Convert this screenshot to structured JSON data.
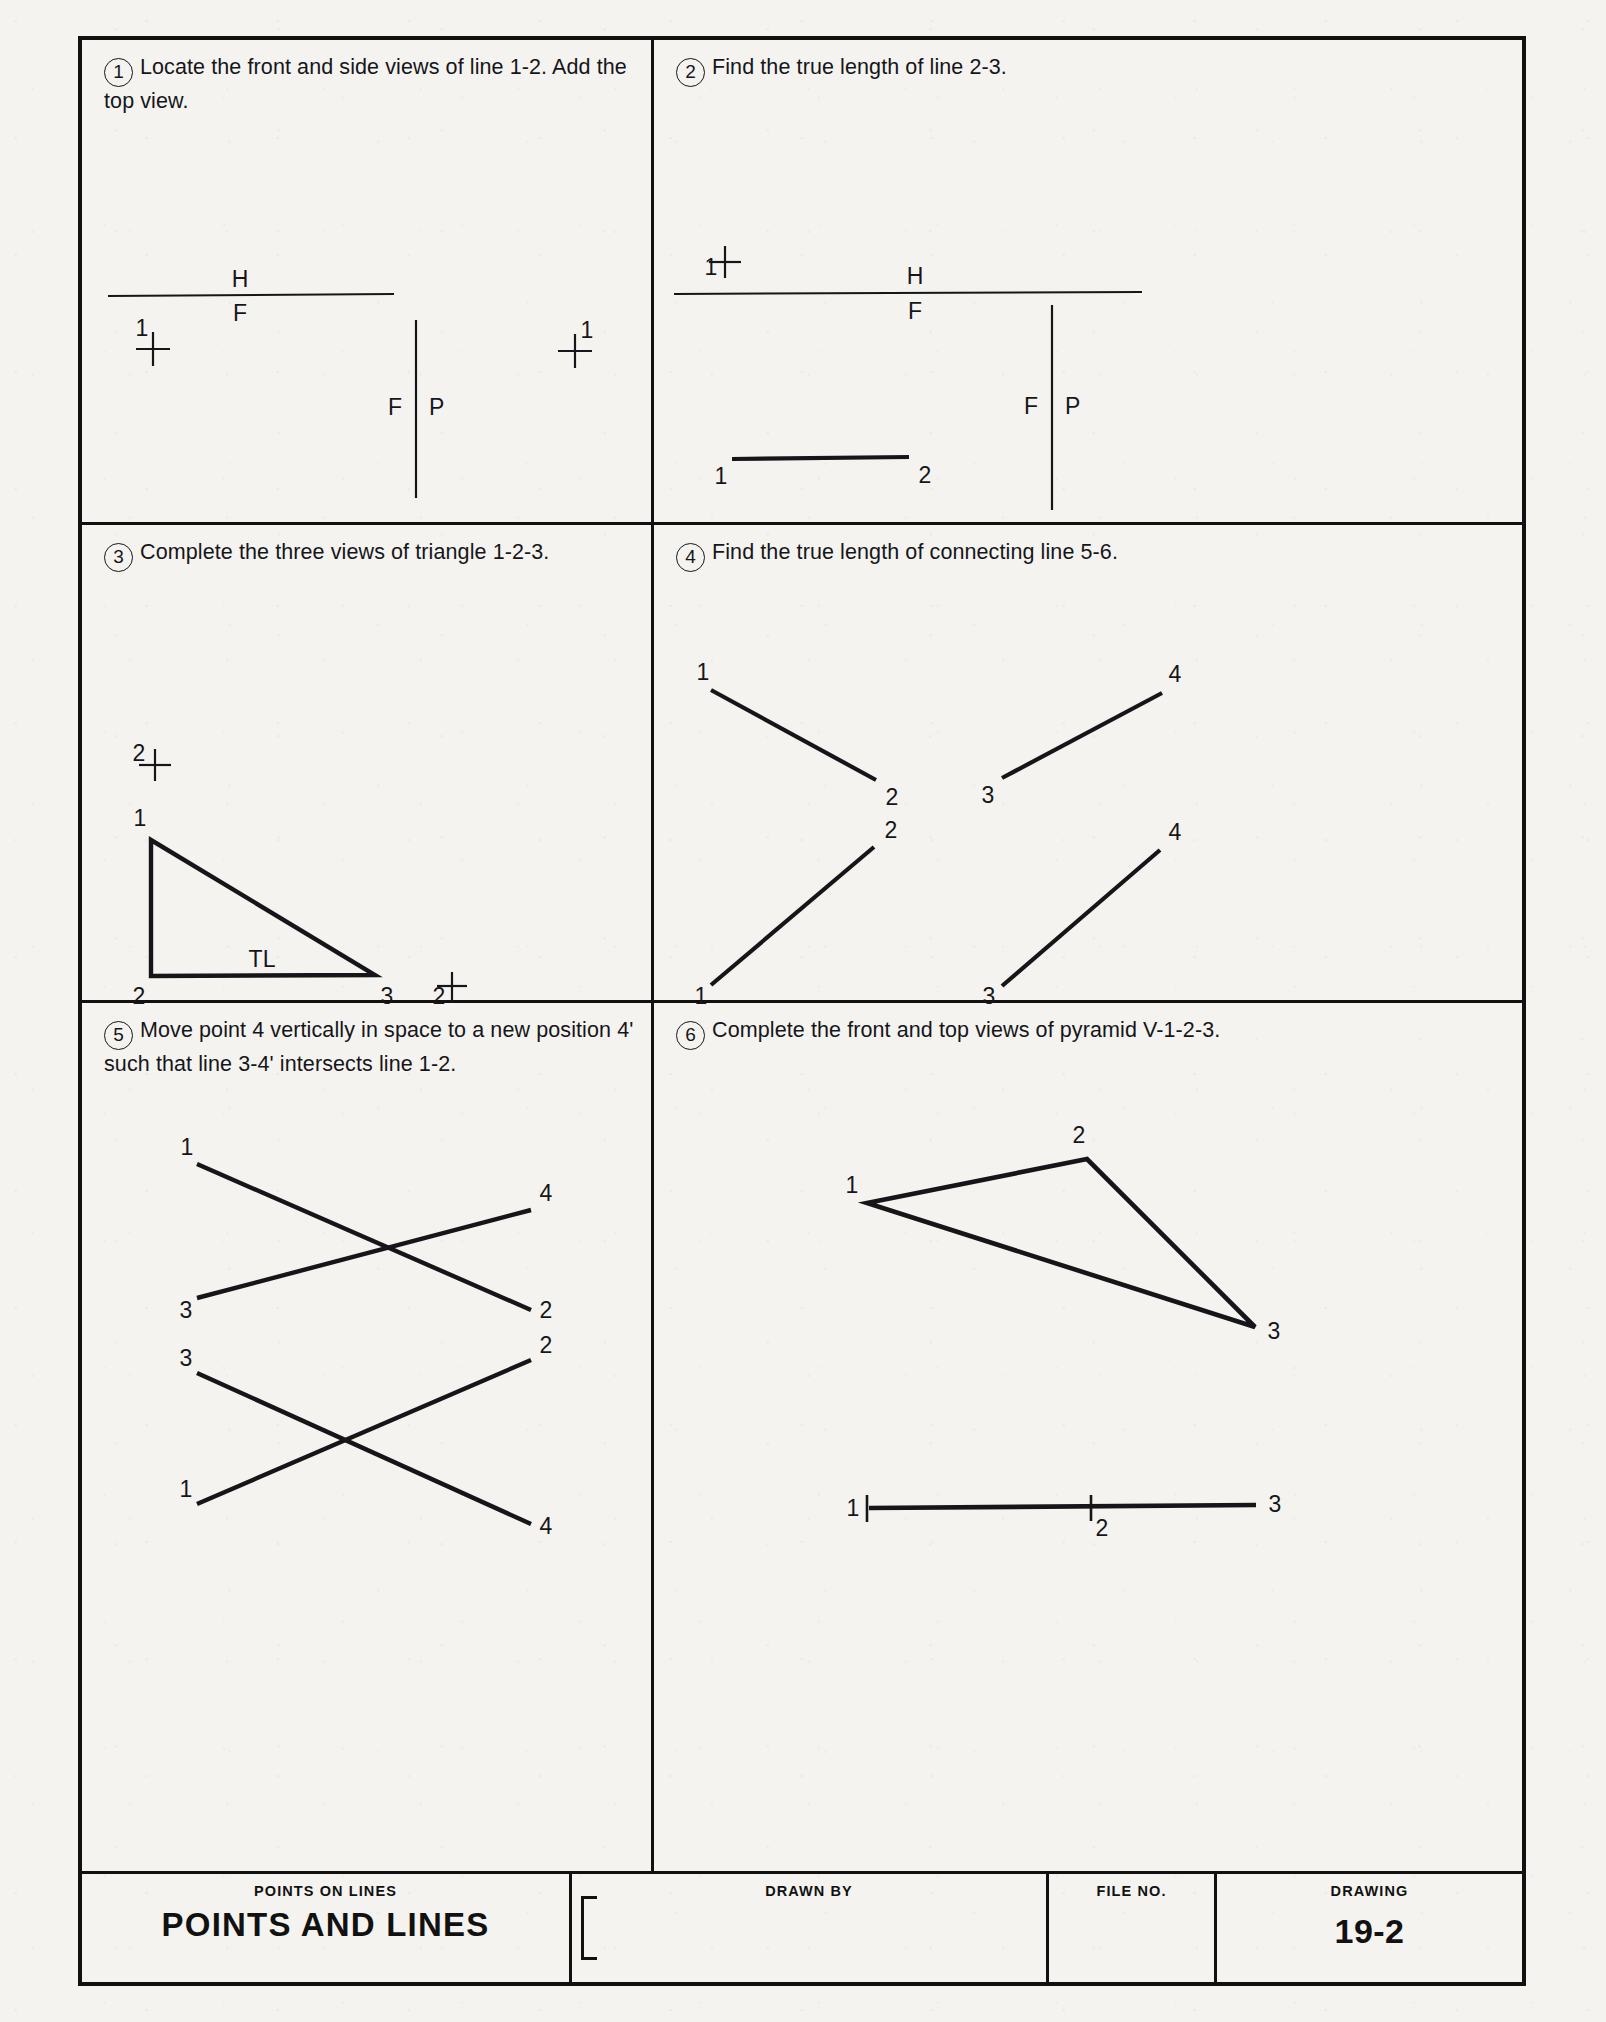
{
  "sheet": {
    "width": 1606,
    "height": 2022,
    "ink_color": "#16161a",
    "paper_color": "#f4f3ef"
  },
  "problems": [
    {
      "number": "1",
      "text": "Locate the front and side views of line 1-2. Add the top view.",
      "labels": {
        "h": "H",
        "f": "F",
        "fp_f": "F",
        "fp_p": "P",
        "pt1_left": "1",
        "pt1_right": "1"
      }
    },
    {
      "number": "2",
      "text": "Find the true length of line 2-3.",
      "labels": {
        "h": "H",
        "f": "F",
        "fp_f": "F",
        "fp_p": "P",
        "pt1_top": "1",
        "pt1_line": "1",
        "pt2_line": "2"
      }
    },
    {
      "number": "3",
      "text": "Complete the three views of triangle 1-2-3.",
      "labels": {
        "pt2_top": "2",
        "pt1": "1",
        "pt2": "2",
        "pt3": "3",
        "tl": "TL",
        "pt2_right": "2"
      }
    },
    {
      "number": "4",
      "text": "Find the true length of connecting line 5-6.",
      "labels": {
        "top_left_1": "1",
        "top_left_2": "2",
        "top_right_3": "3",
        "top_right_4": "4",
        "bot_left_1": "1",
        "bot_left_2": "2",
        "bot_right_3": "3",
        "bot_right_4": "4"
      }
    },
    {
      "number": "5",
      "text": "Move point 4 vertically in space to a new position 4' such that line 3-4' intersects line 1-2.",
      "labels": {
        "top_1": "1",
        "top_4": "4",
        "top_3": "3",
        "top_2": "2",
        "bot_2": "2",
        "bot_3": "3",
        "bot_1": "1",
        "bot_4": "4"
      }
    },
    {
      "number": "6",
      "text": "Complete the front and top views of pyramid V-1-2-3.",
      "labels": {
        "top_1": "1",
        "top_2": "2",
        "top_3": "3",
        "front_1": "1",
        "front_2": "2",
        "front_3": "3"
      }
    }
  ],
  "title_block": {
    "subject_label": "POINTS ON LINES",
    "subject_title": "POINTS AND LINES",
    "drawn_by_label": "DRAWN BY",
    "drawn_by_value": "",
    "file_no_label": "FILE NO.",
    "file_no_value": "",
    "drawing_label": "DRAWING",
    "drawing_number": "19-2"
  }
}
